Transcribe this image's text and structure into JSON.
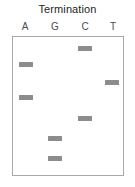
{
  "figure": {
    "title": "Termination",
    "type": "sanger-sequencing-gel",
    "colors": {
      "band": "#8c8c8e",
      "box_border": "#a7a9ac",
      "title_text": "#231f20",
      "label_text": "#4d4d4f",
      "background": "#ffffff"
    }
  },
  "gel": {
    "lanes": [
      {
        "id": "lane-a",
        "label": "A",
        "center_pct": 11.6
      },
      {
        "id": "lane-g",
        "label": "G",
        "center_pct": 38.4
      },
      {
        "id": "lane-c",
        "label": "C",
        "center_pct": 65.2
      },
      {
        "id": "lane-t",
        "label": "T",
        "center_pct": 90.2
      }
    ],
    "bands": [
      {
        "lane": "C",
        "lane_index": 2,
        "x_pct": 65.2,
        "y_pct": 6.4,
        "order": 1
      },
      {
        "lane": "A",
        "lane_index": 0,
        "x_pct": 11.6,
        "y_pct": 17.9,
        "order": 2
      },
      {
        "lane": "T",
        "lane_index": 3,
        "x_pct": 90.2,
        "y_pct": 31.4,
        "order": 3
      },
      {
        "lane": "A",
        "lane_index": 0,
        "x_pct": 11.6,
        "y_pct": 42.1,
        "order": 4
      },
      {
        "lane": "C",
        "lane_index": 2,
        "x_pct": 65.2,
        "y_pct": 57.1,
        "order": 5
      },
      {
        "lane": "G",
        "lane_index": 1,
        "x_pct": 38.4,
        "y_pct": 72.1,
        "order": 6
      },
      {
        "lane": "G",
        "lane_index": 1,
        "x_pct": 38.4,
        "y_pct": 86.4,
        "order": 7
      }
    ],
    "read_top_to_bottom": "C A T A C G G",
    "band_count": 7
  }
}
